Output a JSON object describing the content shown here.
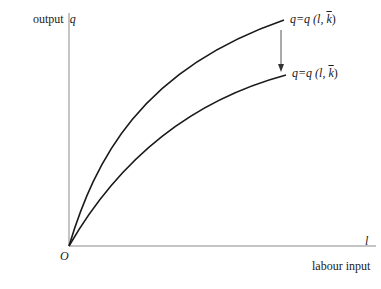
{
  "diagram": {
    "y_axis": {
      "label": "output",
      "symbol": "q"
    },
    "x_axis": {
      "label": "labour input",
      "symbol": "l"
    },
    "origin_label": "O",
    "curves": [
      {
        "id": "upper",
        "label_lhs": "q=q",
        "label_args_pre": "(l, ",
        "label_k": "k",
        "label_args_post": ")"
      },
      {
        "id": "lower",
        "label_lhs": "q=q",
        "label_args_pre": "(l, ",
        "label_k": "k",
        "label_args_post": ")"
      }
    ],
    "arrow": {
      "direction": "down",
      "meaning": "shift from upper to lower curve"
    },
    "colors": {
      "curve": "#1a1a1a",
      "axis": "#7a7a7a",
      "arrow": "#555555",
      "text": "#1a1a1a"
    }
  }
}
